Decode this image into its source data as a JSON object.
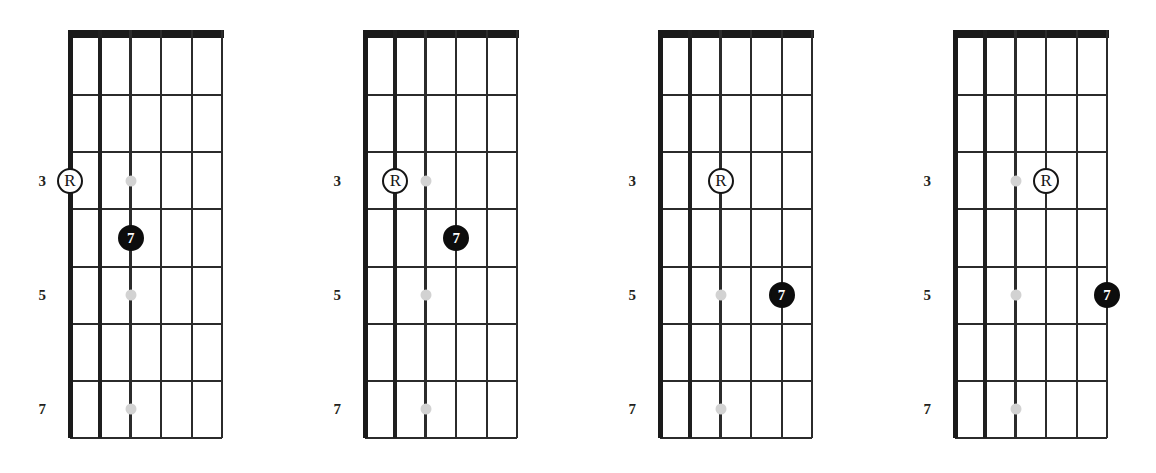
{
  "figure": {
    "type": "guitar-fretboard-diagrams",
    "diagram_count": 4,
    "strings_per_diagram": 6,
    "fret_spaces_per_diagram": 7,
    "colors": {
      "line": "#2b2b2b",
      "nut": "#1a1a1a",
      "inlay_dot": "#d2d2d2",
      "root_marker_fill": "#ffffff",
      "root_marker_text": "#151515",
      "interval_marker_fill": "#0d0d0d",
      "interval_marker_text": "#ffffff",
      "background": "#ffffff"
    }
  },
  "fret_number_labels": [
    "3",
    "5",
    "7"
  ],
  "fret_numbers": [
    3,
    5,
    7
  ],
  "inlay_dots": [
    {
      "string": 3,
      "fret": 3
    },
    {
      "string": 3,
      "fret": 5
    },
    {
      "string": 3,
      "fret": 7
    }
  ],
  "diagrams": [
    {
      "index": 1,
      "markers": [
        {
          "label": "R",
          "kind": "root",
          "string": 1,
          "fret": 3
        },
        {
          "label": "7",
          "kind": "interval",
          "string": 3,
          "fret": 4
        }
      ]
    },
    {
      "index": 2,
      "markers": [
        {
          "label": "R",
          "kind": "root",
          "string": 2,
          "fret": 3
        },
        {
          "label": "7",
          "kind": "interval",
          "string": 4,
          "fret": 4
        }
      ]
    },
    {
      "index": 3,
      "markers": [
        {
          "label": "R",
          "kind": "root",
          "string": 3,
          "fret": 3
        },
        {
          "label": "7",
          "kind": "interval",
          "string": 5,
          "fret": 5
        }
      ]
    },
    {
      "index": 4,
      "markers": [
        {
          "label": "R",
          "kind": "root",
          "string": 4,
          "fret": 3
        },
        {
          "label": "7",
          "kind": "interval",
          "string": 6,
          "fret": 5
        }
      ]
    }
  ]
}
